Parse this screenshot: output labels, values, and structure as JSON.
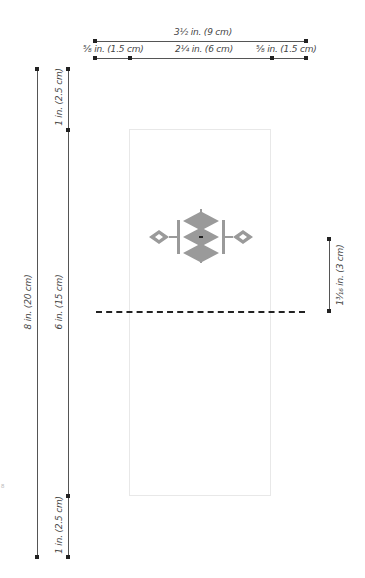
{
  "diagram": {
    "type": "knitting schematic",
    "dimensions": {
      "total_width": "3½ in. (9 cm)",
      "left_margin_width": "⅝ in. (1.5 cm)",
      "center_width": "2¼ in. (6 cm)",
      "right_margin_width": "⅝ in. (1.5 cm)",
      "total_height": "8 in. (20 cm)",
      "top_section_height": "1 in. (2.5 cm)",
      "middle_section_height": "6 in. (15 cm)",
      "bottom_section_height": "1 in. (2.5 cm)",
      "motif_offset_height": "1³⁄₁₆ in. (3 cm)"
    },
    "stray_mark": "8",
    "colors": {
      "lines": "#555555",
      "endpoints": "#222222",
      "panel_border": "#e8e8e8",
      "motif": "#9a9a9a",
      "motif_center": "#222222",
      "fold_line": "#222222"
    }
  }
}
